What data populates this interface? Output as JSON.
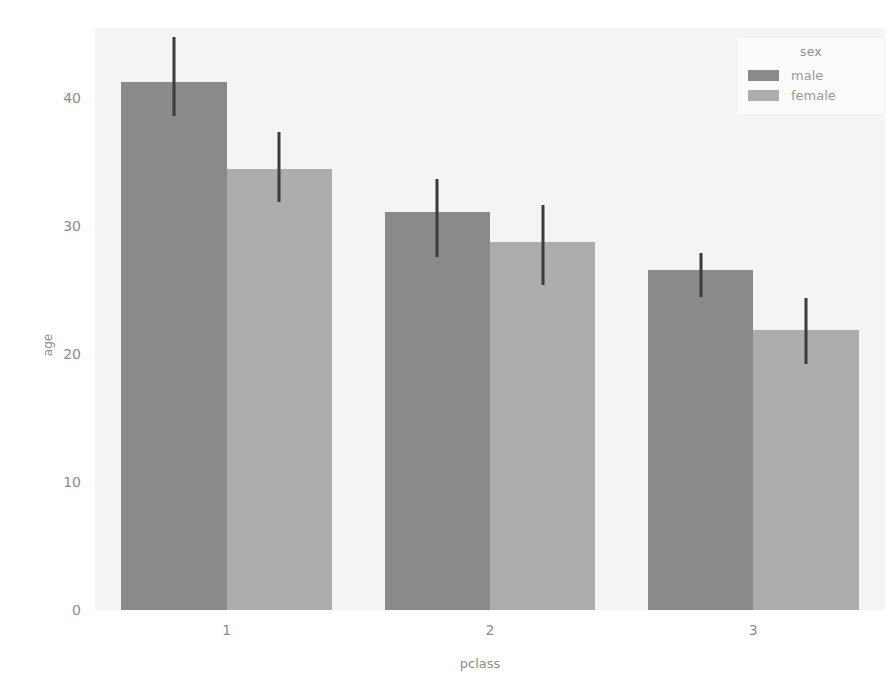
{
  "chart_data": {
    "type": "bar",
    "title": "",
    "xlabel": "pclass",
    "ylabel": "age",
    "categories": [
      "1",
      "2",
      "3"
    ],
    "xtick_labels": [
      "1",
      "2",
      "3"
    ],
    "ytick_labels": [
      "0",
      "10",
      "20",
      "30",
      "40"
    ],
    "yticks": [
      0,
      10,
      20,
      30,
      40
    ],
    "ylim": [
      0,
      45.5
    ],
    "grid": false,
    "legend": {
      "title": "sex",
      "position": "upper right",
      "entries": [
        {
          "label": "male",
          "color": "#8a8a8a"
        },
        {
          "label": "female",
          "color": "#adadad"
        }
      ]
    },
    "series": [
      {
        "name": "male",
        "color": "#8a8a8a",
        "values": [
          41.3,
          31.1,
          26.6
        ],
        "ci_low": [
          38.6,
          27.6,
          24.5
        ],
        "ci_high": [
          44.8,
          33.7,
          27.9
        ]
      },
      {
        "name": "female",
        "color": "#adadad",
        "values": [
          34.5,
          28.8,
          21.9
        ],
        "ci_low": [
          31.9,
          25.4,
          19.2
        ],
        "ci_high": [
          37.4,
          31.7,
          24.4
        ]
      }
    ],
    "errorbar_color": "#3b3b3b",
    "plot_background": "#f4f4f4",
    "figure_background": "#ffffff"
  }
}
